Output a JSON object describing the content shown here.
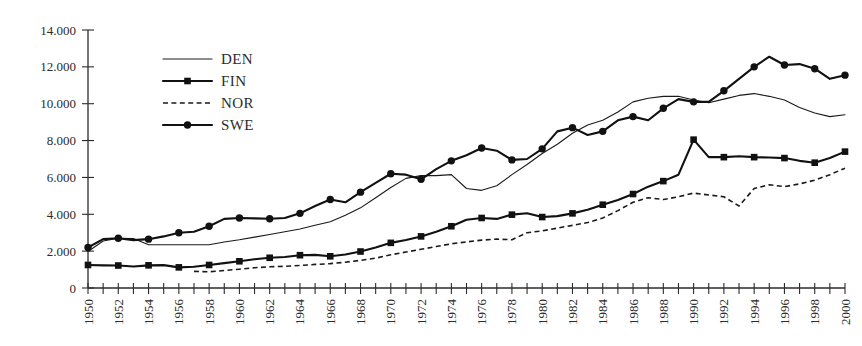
{
  "chart_data": {
    "type": "line",
    "title": "",
    "subtitle": "",
    "xlabel": "",
    "ylabel": "",
    "xlim": [
      1950,
      2000
    ],
    "ylim": [
      0,
      14000
    ],
    "grid": false,
    "legend_position": "upper-left-inside",
    "y_ticks": [
      0,
      2000,
      4000,
      6000,
      8000,
      10000,
      12000,
      14000
    ],
    "y_tick_labels": [
      "0",
      "2.000",
      "4.000",
      "6.000",
      "8.000",
      "10.000",
      "12.000",
      "14.000"
    ],
    "x_ticks_all_years": true,
    "x_tick_label_interval": 2,
    "x_tick_labels": [
      "1950",
      "1952",
      "1954",
      "1956",
      "1958",
      "1960",
      "1962",
      "1964",
      "1966",
      "1968",
      "1970",
      "1972",
      "1974",
      "1976",
      "1978",
      "1980",
      "1982",
      "1984",
      "1986",
      "1988",
      "1990",
      "1992",
      "1994",
      "1996",
      "1998",
      "2000"
    ],
    "x": [
      1950,
      1951,
      1952,
      1953,
      1954,
      1955,
      1956,
      1957,
      1958,
      1959,
      1960,
      1961,
      1962,
      1963,
      1964,
      1965,
      1966,
      1967,
      1968,
      1969,
      1970,
      1971,
      1972,
      1973,
      1974,
      1975,
      1976,
      1977,
      1978,
      1979,
      1980,
      1981,
      1982,
      1983,
      1984,
      1985,
      1986,
      1987,
      1988,
      1989,
      1990,
      1991,
      1992,
      1993,
      1994,
      1995,
      1996,
      1997,
      1998,
      1999,
      2000
    ],
    "series": [
      {
        "name": "DEN",
        "style": "thin-solid",
        "marker": "none",
        "color": "#1a1a1a",
        "values": [
          1980,
          2550,
          2700,
          2680,
          2350,
          2350,
          2350,
          2350,
          2350,
          2500,
          2620,
          2760,
          2900,
          3050,
          3200,
          3400,
          3600,
          3950,
          4350,
          4900,
          5450,
          5950,
          6100,
          6100,
          6150,
          5400,
          5300,
          5550,
          6150,
          6700,
          7300,
          7800,
          8400,
          8850,
          9100,
          9550,
          10100,
          10300,
          10400,
          10400,
          10200,
          10050,
          10250,
          10450,
          10550,
          10400,
          10200,
          9800,
          9500,
          9300,
          9400
        ]
      },
      {
        "name": "FIN",
        "style": "thick-solid",
        "marker": "square",
        "color": "#111111",
        "values": [
          1250,
          1230,
          1220,
          1170,
          1230,
          1240,
          1120,
          1150,
          1250,
          1350,
          1450,
          1560,
          1640,
          1680,
          1780,
          1800,
          1720,
          1820,
          1980,
          2200,
          2450,
          2600,
          2800,
          3050,
          3350,
          3700,
          3800,
          3750,
          3980,
          4060,
          3850,
          3900,
          4050,
          4250,
          4520,
          4780,
          5100,
          5500,
          5800,
          6150,
          8050,
          7100,
          7100,
          7150,
          7100,
          7080,
          7050,
          6900,
          6800,
          7050,
          7400
        ]
      },
      {
        "name": "NOR",
        "style": "dashed",
        "marker": "none",
        "color": "#1a1a1a",
        "start_year": 1957,
        "values": [
          null,
          null,
          null,
          null,
          null,
          null,
          null,
          900,
          880,
          950,
          1020,
          1100,
          1150,
          1180,
          1220,
          1280,
          1320,
          1400,
          1500,
          1620,
          1800,
          1950,
          2100,
          2250,
          2400,
          2500,
          2600,
          2650,
          2620,
          3000,
          3100,
          3250,
          3400,
          3550,
          3800,
          4200,
          4650,
          4900,
          4800,
          4950,
          5150,
          5050,
          4950,
          4450,
          5400,
          5600,
          5500,
          5650,
          5850,
          6150,
          6500
        ]
      },
      {
        "name": "SWE",
        "style": "thick-solid",
        "marker": "circle",
        "color": "#111111",
        "values": [
          2200,
          2650,
          2700,
          2600,
          2650,
          2800,
          3000,
          3050,
          3350,
          3750,
          3800,
          3780,
          3760,
          3800,
          4050,
          4450,
          4800,
          4650,
          5200,
          5700,
          6200,
          6150,
          5900,
          6450,
          6900,
          7200,
          7600,
          7450,
          6950,
          7000,
          7550,
          8500,
          8700,
          8300,
          8500,
          9100,
          9300,
          9100,
          9750,
          10250,
          10100,
          10100,
          10700,
          11350,
          12000,
          12550,
          12100,
          12150,
          11900,
          11350,
          11550
        ]
      }
    ]
  },
  "legend": {
    "items": [
      {
        "label": "DEN"
      },
      {
        "label": "FIN"
      },
      {
        "label": "NOR"
      },
      {
        "label": "SWE"
      }
    ]
  }
}
